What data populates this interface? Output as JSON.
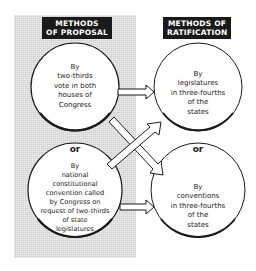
{
  "headers": {
    "proposal": "METHODS\nOF PROPOSAL",
    "ratification": "METHODS OF\nRATIFICATION"
  },
  "proposal_methods": [
    {
      "text": "By\ntwo-thirds\nvote in both\nhouses of\nCongress"
    },
    {
      "text": "By\nnational\nconstitutional\nconvention called\nby Congress on\nrequest of two-thirds\nof state\nlegislatures"
    }
  ],
  "ratification_methods": [
    {
      "text": "By\nlegislatures\nin three-fourths\nof the\nstates"
    },
    {
      "text": "By\nconventions\nin three-fourths\nof the\nstates"
    }
  ],
  "separators": {
    "left_or": "or",
    "right_or": "or"
  },
  "arrows": [
    {
      "from": "proposal_methods.0",
      "to": "ratification_methods.0"
    },
    {
      "from": "proposal_methods.0",
      "to": "ratification_methods.1"
    },
    {
      "from": "proposal_methods.1",
      "to": "ratification_methods.0"
    },
    {
      "from": "proposal_methods.1",
      "to": "ratification_methods.1"
    }
  ],
  "colors": {
    "panel": "#cfcfcf",
    "header_bg": "#1a1a1a",
    "stroke": "#1a1a1a"
  }
}
